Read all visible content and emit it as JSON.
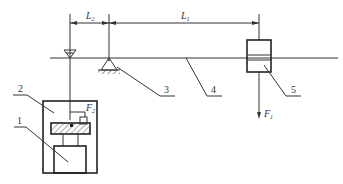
{
  "diagram": {
    "type": "mechanical schematic",
    "dimensions": {
      "L2": {
        "symbol": "L",
        "subscript": "2"
      },
      "L1": {
        "symbol": "L",
        "subscript": "1"
      }
    },
    "forces": {
      "F1": {
        "symbol": "F",
        "subscript": "1",
        "direction": "down"
      },
      "F2": {
        "symbol": "F",
        "subscript": "2"
      }
    },
    "part_labels": [
      {
        "id": "1",
        "text": "1"
      },
      {
        "id": "2",
        "text": "2"
      },
      {
        "id": "3",
        "text": "3"
      },
      {
        "id": "4",
        "text": "4"
      },
      {
        "id": "5",
        "text": "5"
      }
    ],
    "colors": {
      "line": "#333333",
      "background": "#ffffff"
    }
  }
}
